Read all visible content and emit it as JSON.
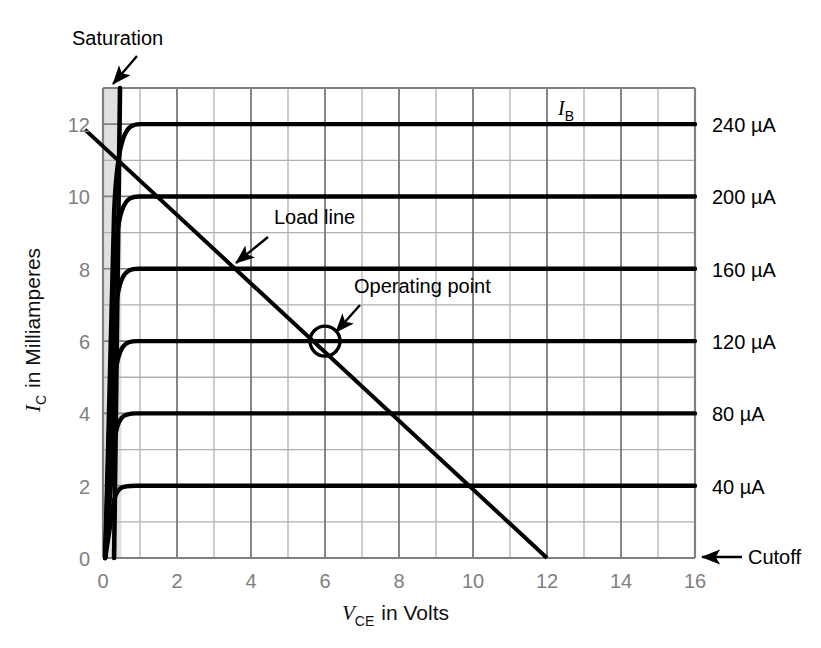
{
  "chart_data": {
    "type": "line",
    "title": "",
    "xlabel": "V_CE in Volts",
    "ylabel": "I_C in Milliamperes",
    "xlabel_parts": {
      "symbol": "V",
      "subscript": "CE",
      "rest": "in Volts"
    },
    "ylabel_parts": {
      "symbol": "I",
      "subscript": "C",
      "rest": "in Milliamperes"
    },
    "xlim": [
      0,
      16
    ],
    "ylim": [
      0,
      13
    ],
    "xticks": [
      "0",
      "2",
      "4",
      "6",
      "8",
      "10",
      "12",
      "14",
      "16"
    ],
    "xtick_values": [
      0,
      2,
      4,
      6,
      8,
      10,
      12,
      14,
      16
    ],
    "yticks": [
      "0",
      "2",
      "4",
      "6",
      "8",
      "10",
      "12"
    ],
    "ytick_values": [
      0,
      2,
      4,
      6,
      8,
      10,
      12
    ],
    "grid": true,
    "grid_major_x_step": 2,
    "grid_minor_x_step": 1,
    "grid_major_y_step": 1,
    "legend_position": "right-of-axes",
    "series_legend_title": "I_B",
    "series_legend_title_parts": {
      "symbol": "I",
      "subscript": "B"
    },
    "series": [
      {
        "name": "240 µA",
        "ib_ua": 240,
        "ic_ma": 12,
        "knee_v": 0.45,
        "label": "240 µA"
      },
      {
        "name": "200 µA",
        "ib_ua": 200,
        "ic_ma": 10,
        "knee_v": 0.42,
        "label": "200 µA"
      },
      {
        "name": "160 µA",
        "ib_ua": 160,
        "ic_ma": 8,
        "knee_v": 0.4,
        "label": "160 µA"
      },
      {
        "name": "120 µA",
        "ib_ua": 120,
        "ic_ma": 6,
        "knee_v": 0.38,
        "label": "120 µA"
      },
      {
        "name": "80 µA",
        "ib_ua": 80,
        "ic_ma": 4,
        "knee_v": 0.35,
        "label": "80 µA"
      },
      {
        "name": "40 µA",
        "ib_ua": 40,
        "ic_ma": 2,
        "knee_v": 0.32,
        "label": "40 µA"
      }
    ],
    "load_line": {
      "name": "Load line",
      "x_intercept_v": 12,
      "y_intercept_ma": 12.35,
      "points": [
        [
          0,
          12.35
        ],
        [
          12,
          0
        ]
      ]
    },
    "operating_point": {
      "name": "Operating point",
      "v_ce": 6,
      "i_c": 6,
      "marker": "open-circle"
    },
    "saturation_region": {
      "name": "Saturation",
      "x_start_v": 0,
      "x_end_v": 0.5,
      "fill": "#e0e0e0"
    },
    "cutoff": {
      "name": "Cutoff",
      "i_c": 0
    },
    "annotations": [
      {
        "id": "saturation",
        "text": "Saturation",
        "points_to": [
          0.25,
          13
        ]
      },
      {
        "id": "load_line",
        "text": "Load line",
        "points_to": [
          4.9,
          7.1
        ]
      },
      {
        "id": "operating_point",
        "text": "Operating point",
        "points_to": [
          6.2,
          6.2
        ]
      },
      {
        "id": "cutoff",
        "text": "Cutoff",
        "points_to": [
          16,
          0
        ]
      },
      {
        "id": "ib",
        "text": "I_B",
        "points_to": [
          12.5,
          12.6
        ]
      }
    ],
    "colors": {
      "curve": "#000000",
      "grid_major": "#808080",
      "grid_minor": "#b0b0b0",
      "axis": "#808080",
      "tick_text": "#808080",
      "annotation_text": "#000000",
      "saturation_fill": "#e0e0e0",
      "background": "#ffffff"
    }
  }
}
